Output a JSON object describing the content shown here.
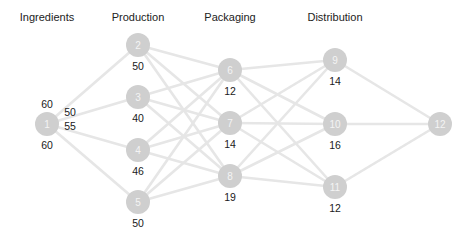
{
  "chart_data": {
    "type": "network",
    "title": "",
    "stages": [
      "Ingredients",
      "Production",
      "Packaging",
      "Distribution"
    ],
    "nodes": [
      {
        "id": "1",
        "stage": "Ingredients",
        "x": 47,
        "y": 124,
        "labels": [
          {
            "text": "60",
            "dx": 0,
            "dy": -26
          },
          {
            "text": "50",
            "dx": 23,
            "dy": -18
          },
          {
            "text": "55",
            "dx": 23,
            "dy": -4
          },
          {
            "text": "60",
            "dx": 0,
            "dy": 15
          }
        ]
      },
      {
        "id": "2",
        "stage": "Production",
        "x": 138,
        "y": 45,
        "value": "50"
      },
      {
        "id": "3",
        "stage": "Production",
        "x": 138,
        "y": 97,
        "value": "40"
      },
      {
        "id": "4",
        "stage": "Production",
        "x": 138,
        "y": 150,
        "value": "46"
      },
      {
        "id": "5",
        "stage": "Production",
        "x": 138,
        "y": 202,
        "value": "50"
      },
      {
        "id": "6",
        "stage": "Packaging",
        "x": 230,
        "y": 70,
        "value": "12"
      },
      {
        "id": "7",
        "stage": "Packaging",
        "x": 230,
        "y": 123,
        "value": "14"
      },
      {
        "id": "8",
        "stage": "Packaging",
        "x": 230,
        "y": 176,
        "value": "19"
      },
      {
        "id": "9",
        "stage": "Distribution",
        "x": 335,
        "y": 60,
        "value": "14"
      },
      {
        "id": "10",
        "stage": "Distribution",
        "x": 335,
        "y": 124,
        "value": "16"
      },
      {
        "id": "11",
        "stage": "Distribution",
        "x": 335,
        "y": 187,
        "value": "12"
      },
      {
        "id": "12",
        "stage": "",
        "x": 440,
        "y": 124
      }
    ],
    "edges": [
      [
        "1",
        "2"
      ],
      [
        "1",
        "3"
      ],
      [
        "1",
        "4"
      ],
      [
        "1",
        "5"
      ],
      [
        "2",
        "6"
      ],
      [
        "2",
        "7"
      ],
      [
        "2",
        "8"
      ],
      [
        "3",
        "6"
      ],
      [
        "3",
        "7"
      ],
      [
        "3",
        "8"
      ],
      [
        "4",
        "6"
      ],
      [
        "4",
        "7"
      ],
      [
        "4",
        "8"
      ],
      [
        "5",
        "6"
      ],
      [
        "5",
        "7"
      ],
      [
        "5",
        "8"
      ],
      [
        "6",
        "9"
      ],
      [
        "6",
        "10"
      ],
      [
        "6",
        "11"
      ],
      [
        "7",
        "9"
      ],
      [
        "7",
        "10"
      ],
      [
        "7",
        "11"
      ],
      [
        "8",
        "9"
      ],
      [
        "8",
        "10"
      ],
      [
        "8",
        "11"
      ],
      [
        "9",
        "12"
      ],
      [
        "10",
        "12"
      ],
      [
        "11",
        "12"
      ]
    ],
    "colors": {
      "node": "#cfcfcf",
      "edge": "#e6e6e6",
      "node_text": "#f4f4f4",
      "label_text": "#1a1a1a"
    }
  },
  "stage_titles": [
    {
      "label": "Ingredients",
      "x": 47
    },
    {
      "label": "Production",
      "x": 138
    },
    {
      "label": "Packaging",
      "x": 230
    },
    {
      "label": "Distribution",
      "x": 335
    }
  ]
}
